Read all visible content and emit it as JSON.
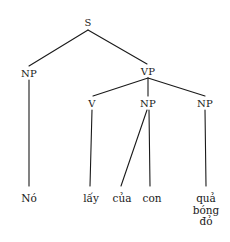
{
  "figure": {
    "type": "syntax-tree",
    "language": "Vietnamese",
    "background_color": "#ffffff",
    "line_color": "#1a1a1a",
    "text_color": "#1a1a1a"
  },
  "nodes": {
    "s": {
      "label": "S",
      "x": 88,
      "y": 22
    },
    "np_subject": {
      "label": "NP",
      "x": 29,
      "y": 73
    },
    "vp": {
      "label": "VP",
      "x": 148,
      "y": 71
    },
    "v": {
      "label": "V",
      "x": 92,
      "y": 103
    },
    "np_object1": {
      "label": "NP",
      "x": 148,
      "y": 103
    },
    "np_object2": {
      "label": "NP",
      "x": 205,
      "y": 103
    }
  },
  "terminals": {
    "no": {
      "label": "Nó",
      "x": 29,
      "y": 193
    },
    "lay": {
      "label": "lấy",
      "x": 91,
      "y": 193
    },
    "cua": {
      "label": "của",
      "x": 122,
      "y": 193
    },
    "con": {
      "label": "con",
      "x": 152,
      "y": 193
    },
    "qua_bong_do": {
      "lines": [
        "quả",
        "bóng",
        "đỏ"
      ],
      "x": 206,
      "y": 193
    }
  },
  "edges": [
    {
      "name": "s-to-np-subject",
      "x1": 88,
      "y1": 30,
      "x2": 29,
      "y2": 66
    },
    {
      "name": "s-to-vp",
      "x1": 88,
      "y1": 30,
      "x2": 147,
      "y2": 64
    },
    {
      "name": "np-subject-to-no",
      "x1": 29,
      "y1": 80,
      "x2": 29,
      "y2": 186
    },
    {
      "name": "vp-to-v",
      "x1": 148,
      "y1": 78,
      "x2": 93,
      "y2": 96
    },
    {
      "name": "vp-to-np-object1",
      "x1": 148,
      "y1": 78,
      "x2": 148,
      "y2": 96
    },
    {
      "name": "vp-to-np-object2",
      "x1": 148,
      "y1": 78,
      "x2": 205,
      "y2": 96
    },
    {
      "name": "v-to-lay",
      "x1": 92,
      "y1": 110,
      "x2": 90,
      "y2": 186
    },
    {
      "name": "np-object1-to-cua",
      "x1": 147,
      "y1": 110,
      "x2": 121,
      "y2": 186
    },
    {
      "name": "np-object1-to-con",
      "x1": 149,
      "y1": 110,
      "x2": 150,
      "y2": 186
    },
    {
      "name": "np-object2-to-qua-bong-do",
      "x1": 205,
      "y1": 110,
      "x2": 206,
      "y2": 186
    }
  ]
}
